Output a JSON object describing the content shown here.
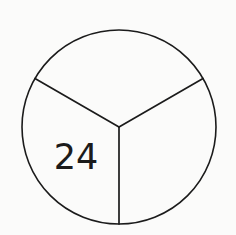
{
  "figure": {
    "kind": "fraction-circle-diagram",
    "background_color": "#fbfbfa",
    "stroke_color": "#1b1b1b",
    "label_color": "#1b1b1b",
    "stroke_width": 1.6,
    "circle": {
      "center_x": 119,
      "center_y": 127,
      "radius": 97
    },
    "divisions": 3,
    "radius_angles_deg": [
      90,
      210,
      330
    ],
    "sectors": [
      {
        "name": "lower-left-sector",
        "label": "24",
        "label_x": 76,
        "label_y": 169
      },
      {
        "name": "top-sector",
        "label": ""
      },
      {
        "name": "lower-right-sector",
        "label": ""
      }
    ]
  },
  "labels": {
    "value": "24"
  }
}
